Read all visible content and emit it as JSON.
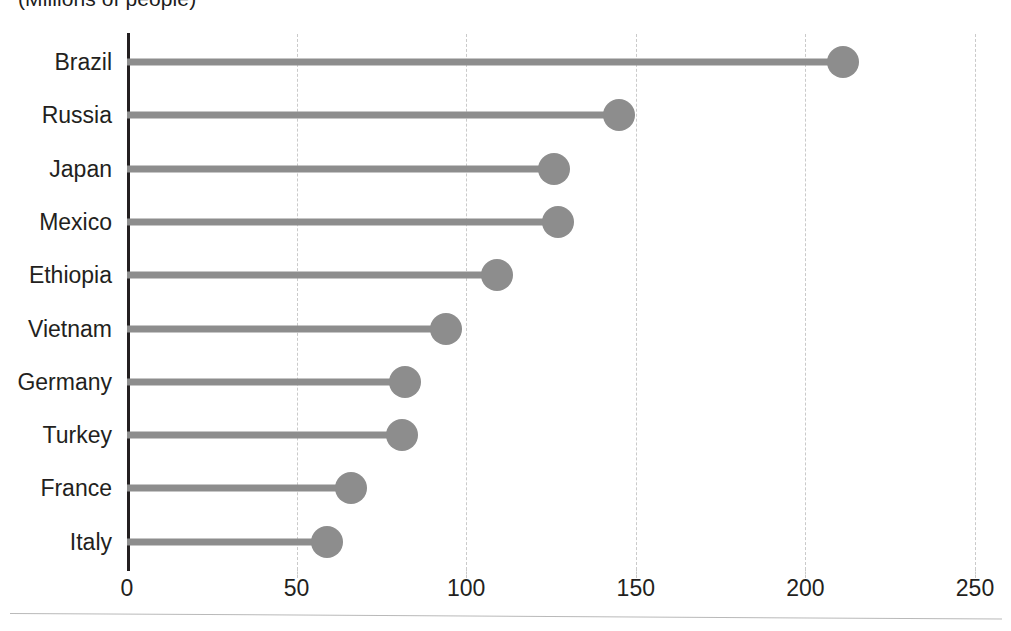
{
  "chart_data": {
    "type": "bar",
    "subtype": "lollipop-horizontal",
    "title": "(Millions of people)",
    "xlabel": "",
    "ylabel": "",
    "categories": [
      "Brazil",
      "Russia",
      "Japan",
      "Mexico",
      "Ethiopia",
      "Vietnam",
      "Germany",
      "Turkey",
      "France",
      "Italy"
    ],
    "values": [
      211,
      145,
      126,
      127,
      109,
      94,
      82,
      81,
      66,
      59
    ],
    "xlim": [
      0,
      250
    ],
    "xticks": [
      0,
      50,
      100,
      150,
      200,
      250
    ],
    "xticklabels": [
      "0",
      "50",
      "100",
      "150",
      "200",
      "250"
    ],
    "grid": "vertical-dashed",
    "legend": "none",
    "series": [
      {
        "name": "Population",
        "unit": "millions of people",
        "values": [
          211,
          145,
          126,
          127,
          109,
          94,
          82,
          81,
          66,
          59
        ]
      }
    ]
  },
  "style": {
    "marker_color": "#8d8d8d",
    "stem_color": "#8d8d8d",
    "axis_color": "#231f20",
    "grid_color": "#cacaca",
    "text_color": "#231f20",
    "background": "#ffffff"
  }
}
